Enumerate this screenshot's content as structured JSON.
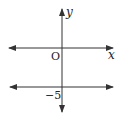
{
  "diagram": {
    "type": "coordinate-plane",
    "axes": {
      "x_label": "x",
      "y_label": "y",
      "origin_label": "O"
    },
    "lines": [
      {
        "equation": "y = -5",
        "orientation": "horizontal",
        "y_intercept_label": "−5"
      }
    ],
    "colors": {
      "stroke": "#333333",
      "text": "#222222"
    }
  }
}
